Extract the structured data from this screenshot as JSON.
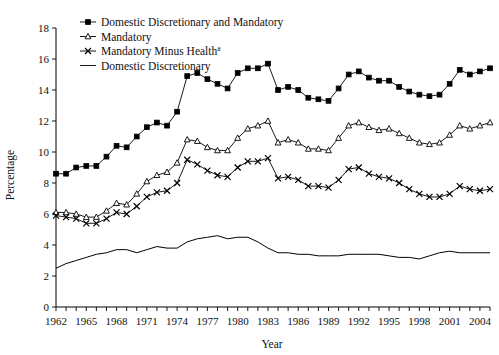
{
  "chart_data": {
    "type": "line",
    "title": "",
    "xlabel": "Year",
    "ylabel": "Percentage",
    "ylim": [
      0,
      18
    ],
    "ytick_step": 2,
    "yticks": [
      0,
      2,
      4,
      6,
      8,
      10,
      12,
      14,
      16,
      18
    ],
    "xlim": [
      1962,
      2005
    ],
    "xticks_labeled": [
      1962,
      1965,
      1968,
      1971,
      1974,
      1977,
      1980,
      1983,
      1986,
      1989,
      1992,
      1995,
      1998,
      2001,
      2004
    ],
    "xtick_step": 1,
    "grid": false,
    "legend_position": "top-left-inside",
    "x": [
      1962,
      1963,
      1964,
      1965,
      1966,
      1967,
      1968,
      1969,
      1970,
      1971,
      1972,
      1973,
      1974,
      1975,
      1976,
      1977,
      1978,
      1979,
      1980,
      1981,
      1982,
      1983,
      1984,
      1985,
      1986,
      1987,
      1988,
      1989,
      1990,
      1991,
      1992,
      1993,
      1994,
      1995,
      1996,
      1997,
      1998,
      1999,
      2000,
      2001,
      2002,
      2003,
      2004,
      2005
    ],
    "series": [
      {
        "name": "Domestic Discretionary and Mandatory",
        "marker": "filled-square",
        "values": [
          8.6,
          8.6,
          9.0,
          9.1,
          9.1,
          9.7,
          10.4,
          10.3,
          11.0,
          11.6,
          11.9,
          11.7,
          12.6,
          14.9,
          15.1,
          14.7,
          14.4,
          14.1,
          15.1,
          15.4,
          15.4,
          15.7,
          14.0,
          14.2,
          14.0,
          13.5,
          13.4,
          13.3,
          14.1,
          15.0,
          15.2,
          14.8,
          14.6,
          14.6,
          14.2,
          13.9,
          13.7,
          13.6,
          13.7,
          14.4,
          15.3,
          15.0,
          15.2,
          15.4
        ]
      },
      {
        "name": "Mandatory",
        "marker": "open-triangle",
        "values": [
          6.1,
          6.1,
          6.0,
          5.8,
          5.8,
          6.2,
          6.7,
          6.6,
          7.3,
          8.1,
          8.5,
          8.7,
          9.3,
          10.8,
          10.7,
          10.3,
          10.1,
          10.1,
          10.9,
          11.5,
          11.7,
          12.0,
          10.6,
          10.8,
          10.6,
          10.2,
          10.2,
          10.1,
          10.9,
          11.7,
          11.9,
          11.6,
          11.4,
          11.5,
          11.2,
          10.9,
          10.6,
          10.5,
          10.6,
          11.1,
          11.7,
          11.5,
          11.7,
          11.9
        ]
      },
      {
        "name": "Mandatory Minus Health",
        "marker": "x",
        "superscript": "a",
        "values": [
          5.9,
          5.8,
          5.7,
          5.4,
          5.4,
          5.7,
          6.1,
          6.0,
          6.5,
          7.1,
          7.4,
          7.5,
          8.0,
          9.5,
          9.2,
          8.8,
          8.5,
          8.4,
          9.0,
          9.4,
          9.4,
          9.6,
          8.3,
          8.4,
          8.2,
          7.8,
          7.8,
          7.7,
          8.2,
          8.9,
          9.0,
          8.6,
          8.4,
          8.3,
          8.0,
          7.6,
          7.3,
          7.1,
          7.1,
          7.3,
          7.8,
          7.6,
          7.5,
          7.6
        ]
      },
      {
        "name": "Domestic Discretionary",
        "marker": "none",
        "values": [
          2.5,
          2.8,
          3.0,
          3.2,
          3.4,
          3.5,
          3.7,
          3.7,
          3.5,
          3.7,
          3.9,
          3.8,
          3.8,
          4.2,
          4.4,
          4.5,
          4.6,
          4.4,
          4.5,
          4.5,
          4.2,
          3.8,
          3.5,
          3.5,
          3.4,
          3.4,
          3.3,
          3.3,
          3.3,
          3.4,
          3.4,
          3.4,
          3.4,
          3.3,
          3.2,
          3.2,
          3.1,
          3.3,
          3.5,
          3.6,
          3.5,
          3.5,
          3.5,
          3.5
        ]
      }
    ],
    "legend": [
      {
        "label": "Domestic Discretionary and Mandatory",
        "marker": "filled-square"
      },
      {
        "label": "Mandatory",
        "marker": "open-triangle"
      },
      {
        "label": "Mandatory Minus Health",
        "marker": "x",
        "superscript": "a"
      },
      {
        "label": "Domestic Discretionary",
        "marker": "none"
      }
    ],
    "colors": {
      "series": "#000000",
      "axis": "#000000",
      "background": "#ffffff"
    }
  }
}
